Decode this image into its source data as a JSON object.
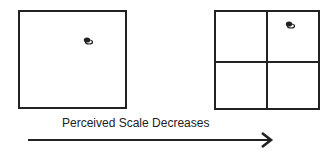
{
  "diagram": {
    "left_panel": {
      "grid": "1x1",
      "marker": "object-glyph"
    },
    "right_panel": {
      "grid": "2x2",
      "marker": "object-glyph"
    },
    "arrow": {
      "label": "Perceived Scale Decreases",
      "direction": "right"
    }
  }
}
